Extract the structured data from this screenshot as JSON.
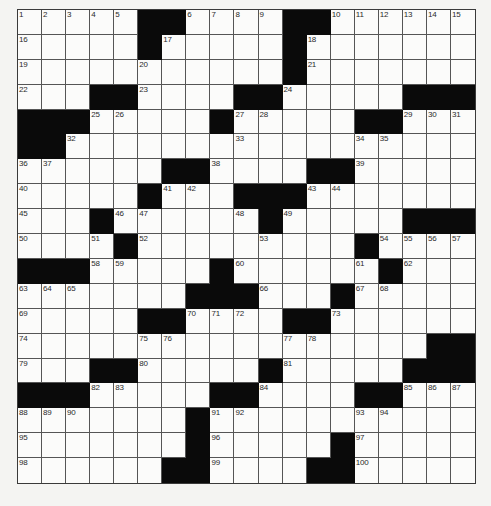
{
  "puzzle": {
    "type": "crossword",
    "cols": 19,
    "rows": 19,
    "colors": {
      "block": "#0a0a0a",
      "cell": "#fbfbfa",
      "background": "#f4f4f2",
      "gridline": "#555555",
      "number": "#2a2a2a"
    },
    "legend": "'#' = black square, '.' = empty white square, number = numbered white square",
    "grid": [
      [
        "1",
        "2",
        "3",
        "4",
        "5",
        "#",
        "#",
        "6",
        "7",
        "8",
        "9",
        "#",
        "#",
        "10",
        "11",
        "12",
        "13",
        "14",
        "15"
      ],
      [
        "16",
        ".",
        ".",
        ".",
        ".",
        "#",
        "17",
        ".",
        ".",
        ".",
        ".",
        "#",
        "18",
        ".",
        ".",
        ".",
        ".",
        ".",
        "."
      ],
      [
        "19",
        ".",
        ".",
        ".",
        ".",
        "20",
        ".",
        ".",
        ".",
        ".",
        ".",
        "#",
        "21",
        ".",
        ".",
        ".",
        ".",
        ".",
        "."
      ],
      [
        "22",
        ".",
        ".",
        "#",
        "#",
        "23",
        ".",
        ".",
        ".",
        "#",
        "#",
        "24",
        ".",
        ".",
        ".",
        ".",
        "#",
        "#",
        "#"
      ],
      [
        "#",
        "#",
        "#",
        "25",
        "26",
        ".",
        ".",
        ".",
        "#",
        "27",
        "28",
        ".",
        ".",
        ".",
        "#",
        "#",
        "29",
        "30",
        "31"
      ],
      [
        "#",
        "#",
        "32",
        ".",
        ".",
        ".",
        ".",
        ".",
        ".",
        "33",
        ".",
        ".",
        ".",
        ".",
        "34",
        "35",
        ".",
        ".",
        "."
      ],
      [
        "36",
        "37",
        ".",
        ".",
        ".",
        ".",
        "#",
        "#",
        "38",
        ".",
        ".",
        ".",
        "#",
        "#",
        "39",
        ".",
        ".",
        ".",
        "."
      ],
      [
        "40",
        ".",
        ".",
        ".",
        ".",
        "#",
        "41",
        "42",
        ".",
        "#",
        "#",
        "#",
        "43",
        "44",
        ".",
        ".",
        ".",
        ".",
        "."
      ],
      [
        "45",
        ".",
        ".",
        "#",
        "46",
        "47",
        ".",
        ".",
        ".",
        "48",
        "#",
        "49",
        ".",
        ".",
        ".",
        ".",
        "#",
        "#",
        "#"
      ],
      [
        "50",
        ".",
        ".",
        "51",
        "#",
        "52",
        ".",
        ".",
        ".",
        ".",
        "53",
        ".",
        ".",
        ".",
        "#",
        "54",
        "55",
        "56",
        "57"
      ],
      [
        "#",
        "#",
        "#",
        "58",
        "59",
        ".",
        ".",
        ".",
        "#",
        "60",
        ".",
        ".",
        ".",
        ".",
        "61",
        "#",
        "62",
        ".",
        "."
      ],
      [
        "63",
        "64",
        "65",
        ".",
        ".",
        ".",
        ".",
        "#",
        "#",
        "#",
        "66",
        ".",
        ".",
        "#",
        "67",
        "68",
        ".",
        ".",
        "."
      ],
      [
        "69",
        ".",
        ".",
        ".",
        ".",
        "#",
        "#",
        "70",
        "71",
        "72",
        ".",
        "#",
        "#",
        "73",
        ".",
        ".",
        ".",
        ".",
        "."
      ],
      [
        "74",
        ".",
        ".",
        ".",
        ".",
        "75",
        "76",
        ".",
        ".",
        ".",
        ".",
        "77",
        "78",
        ".",
        ".",
        ".",
        ".",
        "#",
        "#"
      ],
      [
        "79",
        ".",
        ".",
        "#",
        "#",
        "80",
        ".",
        ".",
        ".",
        ".",
        "#",
        "81",
        ".",
        ".",
        ".",
        ".",
        "#",
        "#",
        "#"
      ],
      [
        "#",
        "#",
        "#",
        "82",
        "83",
        ".",
        ".",
        ".",
        "#",
        "#",
        "84",
        ".",
        ".",
        ".",
        "#",
        "#",
        "85",
        "86",
        "87"
      ],
      [
        "88",
        "89",
        "90",
        ".",
        ".",
        ".",
        ".",
        "#",
        "91",
        "92",
        ".",
        ".",
        ".",
        ".",
        "93",
        "94",
        ".",
        ".",
        "."
      ],
      [
        "95",
        ".",
        ".",
        ".",
        ".",
        ".",
        ".",
        "#",
        "96",
        ".",
        ".",
        ".",
        ".",
        "#",
        "97",
        ".",
        ".",
        ".",
        "."
      ],
      [
        "98",
        ".",
        ".",
        ".",
        ".",
        ".",
        "#",
        "#",
        "99",
        ".",
        ".",
        ".",
        "#",
        "#",
        "100",
        ".",
        ".",
        ".",
        "."
      ]
    ]
  }
}
